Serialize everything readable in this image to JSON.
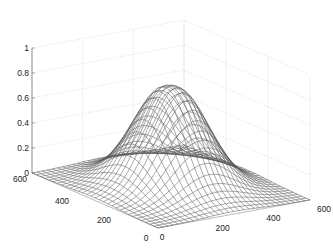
{
  "chart_data": {
    "type": "surface-mesh",
    "title": "",
    "xlabel": "",
    "ylabel": "",
    "zlabel": "",
    "x_ticks": [
      0,
      200,
      400,
      600
    ],
    "y_ticks": [
      0,
      200,
      400,
      600
    ],
    "z_ticks": [
      0,
      0.2,
      0.4,
      0.6,
      0.8,
      1
    ],
    "z_tick_labels": [
      "0",
      "0.2",
      "0.4",
      "0.6",
      "0.8",
      "1"
    ],
    "x_tick_labels": [
      "0",
      "200",
      "400",
      "600"
    ],
    "y_tick_labels": [
      "0",
      "200",
      "400",
      "600"
    ],
    "xlim": [
      0,
      600
    ],
    "ylim": [
      0,
      600
    ],
    "zlim": [
      0,
      1
    ],
    "grid": true,
    "surface": {
      "description": "Radially symmetric Gaussian-like bump centered at (300,300) with a slightly dimpled top, peak about 0.8",
      "center": [
        300,
        300
      ],
      "peak": 0.8,
      "sigma": 110,
      "grid_points": 31
    },
    "line_color": "#555555",
    "grid_color": "#c8c8c8"
  }
}
